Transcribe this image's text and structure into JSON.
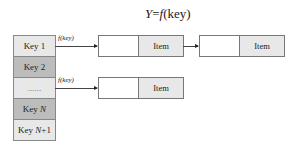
{
  "title": "Y=f(key)",
  "keys": [
    "Key 1",
    "Key 2",
    "......",
    "Key N",
    "Key N+1"
  ],
  "arrow_label": "f(key)",
  "chains": [
    {
      "from_key": "Key 1",
      "nodes": [
        "Item",
        "Item"
      ]
    },
    {
      "from_key": "......",
      "nodes": [
        "Item"
      ]
    }
  ]
}
